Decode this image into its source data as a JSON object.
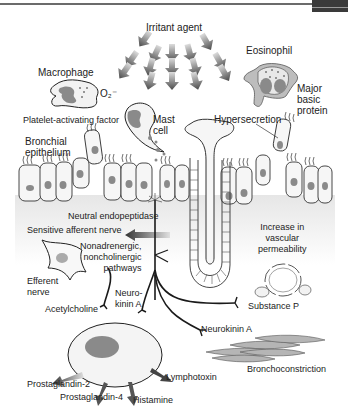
{
  "figure": {
    "colors": {
      "line": "#1a1a1a",
      "cell_fill": "#f4f4f4",
      "nucleus": "#8a8a8a",
      "arrow_gray": "#555555",
      "muscle": "#b5b5b5"
    }
  },
  "labels": {
    "irritant_agent": "Irritant agent",
    "eosinophil": "Eosinophil",
    "macrophage": "Macrophage",
    "superoxide": "O₂⁻",
    "major_basic_protein": "Major basic protein",
    "platelet_activating_factor": "Platelet-activating factor",
    "mast_cell": "Mast cell",
    "hypersecretion": "Hypersecretion",
    "bronchial_epithelium": "Bronchial epithelium",
    "neutral_endopeptidase": "Neutral endopeptidase",
    "sensitive_afferent_nerve": "Sensitive afferent nerve",
    "increase_vascular_permeability": "Increase in vascular permeability",
    "nanc_pathways": "Nonadrenergic, noncholinergic pathways",
    "efferent_nerve": "Efferent nerve",
    "neurokinin_a_left": "Neuro-kinin A",
    "acetylcholine": "Acetylcholine",
    "substance_p": "Substance P",
    "neurokinin_a_right": "Neurokinin A",
    "bronchoconstriction": "Bronchoconstriction",
    "lymphotoxin": "Lymphotoxin",
    "prostaglandin_2": "Prostaglandin-2",
    "prostaglandin_4": "Prostaglandin-4",
    "histamine": "Histamine"
  },
  "split": {
    "major_basic_protein": [
      "Major",
      "basic",
      "protein"
    ],
    "mast_cell": [
      "Mast",
      "cell"
    ],
    "bronchial_epithelium": [
      "Bronchial",
      "epithelium"
    ],
    "increase_vascular_permeability": [
      "Increase in",
      "vascular",
      "permeability"
    ],
    "nanc_pathways": [
      "Nonadrenergic,",
      "noncholinergic",
      "pathways"
    ],
    "efferent_nerve": [
      "Efferent",
      "nerve"
    ],
    "neurokinin_a_left": [
      "Neuro-",
      "kinin A"
    ]
  }
}
